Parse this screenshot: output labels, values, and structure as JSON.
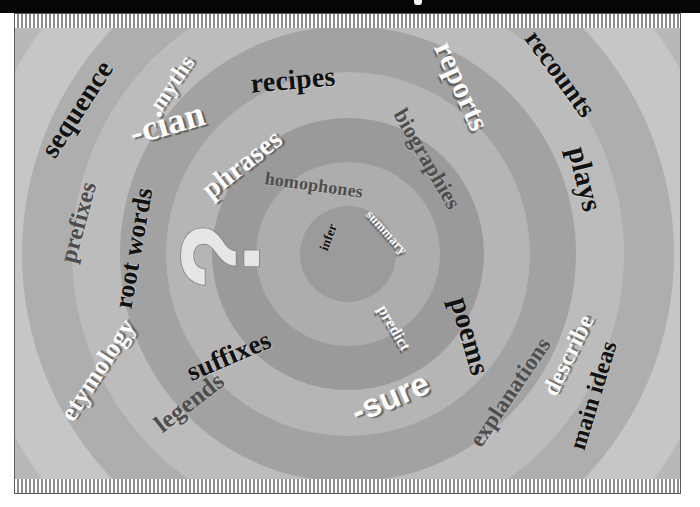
{
  "page": {
    "masthead_color": "#060606",
    "frame_border_color": "#5b5b5b",
    "background_color": "#e8e8e8"
  },
  "center": {
    "symbol": "?",
    "symbol_name": "question-mark",
    "symbol_color": "#e4e4e4",
    "rotation_degrees": -90
  },
  "rings": [
    {
      "index": 0,
      "radius": 48,
      "color": "#9b9b9b"
    },
    {
      "index": 1,
      "radius": 92,
      "color": "#adadad"
    },
    {
      "index": 2,
      "radius": 136,
      "color": "#9a9a9a"
    },
    {
      "index": 3,
      "radius": 182,
      "color": "#b5b5b5"
    },
    {
      "index": 4,
      "radius": 228,
      "color": "#a2a2a2"
    },
    {
      "index": 5,
      "radius": 276,
      "color": "#bcbcbc"
    },
    {
      "index": 6,
      "radius": 326,
      "color": "#aeaeae"
    },
    {
      "index": 7,
      "radius": 380,
      "color": "#c6c6c6"
    },
    {
      "index": 8,
      "radius": 440,
      "color": "#b8b8b8"
    },
    {
      "index": 9,
      "radius": 510,
      "color": "#d0d0d0"
    },
    {
      "index": 10,
      "radius": 590,
      "color": "#c2c2c2"
    },
    {
      "index": 11,
      "radius": 690,
      "color": "#dcdcdc"
    }
  ],
  "words": [
    {
      "text": "infer",
      "tone": "dark",
      "style": "serif",
      "size": 13,
      "x": 313,
      "y": 223,
      "rot": -70
    },
    {
      "text": "summary",
      "tone": "light",
      "style": "serif",
      "size": 13,
      "x": 372,
      "y": 218,
      "rot": 48
    },
    {
      "text": "predict",
      "tone": "light",
      "style": "serif",
      "size": 16,
      "x": 379,
      "y": 314,
      "rot": 60
    },
    {
      "text": "homophones",
      "tone": "mid",
      "style": "serif",
      "size": 18,
      "x": 299,
      "y": 171,
      "rot": 8
    },
    {
      "text": "phrases",
      "tone": "light",
      "style": "serif",
      "size": 28,
      "x": 227,
      "y": 150,
      "rot": -38
    },
    {
      "text": "suffixes",
      "tone": "dark",
      "style": "serif",
      "size": 27,
      "x": 214,
      "y": 342,
      "rot": -23
    },
    {
      "text": "poems",
      "tone": "dark",
      "style": "serif",
      "size": 29,
      "x": 455,
      "y": 322,
      "rot": 74
    },
    {
      "text": "-sure",
      "tone": "light",
      "style": "sans",
      "size": 33,
      "x": 375,
      "y": 383,
      "rot": -23
    },
    {
      "text": "biographies",
      "tone": "mid",
      "style": "serif",
      "size": 22,
      "x": 412,
      "y": 145,
      "rot": 60
    },
    {
      "text": "legends",
      "tone": "mid",
      "style": "serif",
      "size": 25,
      "x": 174,
      "y": 388,
      "rot": -38
    },
    {
      "text": "-cian",
      "tone": "light",
      "style": "serif",
      "size": 36,
      "x": 152,
      "y": 109,
      "rot": -16
    },
    {
      "text": "recipes",
      "tone": "dark",
      "style": "serif",
      "size": 28,
      "x": 278,
      "y": 66,
      "rot": -5
    },
    {
      "text": "reports",
      "tone": "light",
      "style": "serif",
      "size": 30,
      "x": 447,
      "y": 72,
      "rot": 66
    },
    {
      "text": "myths",
      "tone": "light",
      "style": "serif",
      "size": 23,
      "x": 157,
      "y": 69,
      "rot": -56
    },
    {
      "text": "root words",
      "tone": "dark",
      "style": "serif",
      "size": 26,
      "x": 119,
      "y": 234,
      "rot": -80
    },
    {
      "text": "sequence",
      "tone": "dark",
      "style": "serif",
      "size": 28,
      "x": 62,
      "y": 95,
      "rot": -57
    },
    {
      "text": "prefixes",
      "tone": "mid",
      "style": "serif",
      "size": 24,
      "x": 63,
      "y": 208,
      "rot": -75
    },
    {
      "text": "etymology",
      "tone": "light",
      "style": "serif",
      "size": 26,
      "x": 83,
      "y": 356,
      "rot": -57
    },
    {
      "text": "explanations",
      "tone": "mid",
      "style": "serif",
      "size": 23,
      "x": 495,
      "y": 378,
      "rot": -56
    },
    {
      "text": "describe",
      "tone": "light",
      "style": "serif",
      "size": 24,
      "x": 553,
      "y": 341,
      "rot": -64
    },
    {
      "text": "main ideas",
      "tone": "dark",
      "style": "serif",
      "size": 24,
      "x": 578,
      "y": 381,
      "rot": -73
    },
    {
      "text": "plays",
      "tone": "dark",
      "style": "serif",
      "size": 29,
      "x": 570,
      "y": 165,
      "rot": 76
    },
    {
      "text": "recounts",
      "tone": "dark",
      "style": "serif",
      "size": 27,
      "x": 545,
      "y": 60,
      "rot": 54
    }
  ],
  "hatch_bands": {
    "top_label": "top-pinstripe-band",
    "bottom_label": "bottom-pinstripe-band",
    "stripe_light": "#ffffff",
    "stripe_dark": "#8d8d8d"
  }
}
